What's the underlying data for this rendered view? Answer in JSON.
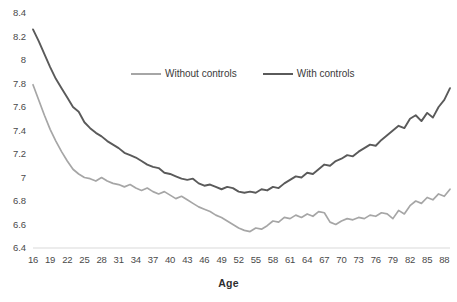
{
  "chart_data": {
    "type": "line",
    "title": "",
    "xlabel": "Age",
    "ylabel": "",
    "xlim": [
      16,
      89
    ],
    "ylim": [
      6.4,
      8.4
    ],
    "grid": false,
    "legend_position": "top-center",
    "x_tick_labels": [
      "16",
      "19",
      "22",
      "25",
      "28",
      "31",
      "34",
      "37",
      "40",
      "43",
      "46",
      "49",
      "52",
      "55",
      "58",
      "61",
      "64",
      "67",
      "70",
      "73",
      "76",
      "79",
      "82",
      "85",
      "88"
    ],
    "y_tick_labels": [
      "8.4",
      "8.2",
      "8",
      "7.8",
      "7.6",
      "7.4",
      "7.2",
      "7",
      "6.8",
      "6.6",
      "6.4"
    ],
    "y_tick_values": [
      8.4,
      8.2,
      8.0,
      7.8,
      7.6,
      7.4,
      7.2,
      7.0,
      6.8,
      6.6,
      6.4
    ],
    "x": [
      16,
      17,
      18,
      19,
      20,
      21,
      22,
      23,
      24,
      25,
      26,
      27,
      28,
      29,
      30,
      31,
      32,
      33,
      34,
      35,
      36,
      37,
      38,
      39,
      40,
      41,
      42,
      43,
      44,
      45,
      46,
      47,
      48,
      49,
      50,
      51,
      52,
      53,
      54,
      55,
      56,
      57,
      58,
      59,
      60,
      61,
      62,
      63,
      64,
      65,
      66,
      67,
      68,
      69,
      70,
      71,
      72,
      73,
      74,
      75,
      76,
      77,
      78,
      79,
      80,
      81,
      82,
      83,
      84,
      85,
      86,
      87,
      88,
      89
    ],
    "series": [
      {
        "name": "With controls",
        "color": "#5a5a5a",
        "values": [
          8.26,
          8.16,
          8.05,
          7.94,
          7.84,
          7.76,
          7.68,
          7.6,
          7.56,
          7.47,
          7.42,
          7.38,
          7.35,
          7.31,
          7.28,
          7.25,
          7.21,
          7.19,
          7.17,
          7.14,
          7.11,
          7.09,
          7.08,
          7.04,
          7.03,
          7.01,
          6.99,
          6.98,
          6.99,
          6.95,
          6.93,
          6.94,
          6.92,
          6.9,
          6.92,
          6.91,
          6.88,
          6.87,
          6.88,
          6.87,
          6.9,
          6.89,
          6.92,
          6.91,
          6.95,
          6.98,
          7.01,
          7.0,
          7.04,
          7.03,
          7.07,
          7.11,
          7.1,
          7.14,
          7.16,
          7.19,
          7.18,
          7.22,
          7.25,
          7.28,
          7.27,
          7.32,
          7.36,
          7.4,
          7.44,
          7.42,
          7.5,
          7.53,
          7.48,
          7.55,
          7.51,
          7.6,
          7.66,
          7.76
        ]
      },
      {
        "name": "Without controls",
        "color": "#a6a6a6",
        "values": [
          7.79,
          7.66,
          7.53,
          7.41,
          7.31,
          7.22,
          7.14,
          7.07,
          7.03,
          7.0,
          6.99,
          6.97,
          7.0,
          6.97,
          6.95,
          6.94,
          6.92,
          6.94,
          6.91,
          6.89,
          6.91,
          6.88,
          6.86,
          6.88,
          6.85,
          6.82,
          6.84,
          6.81,
          6.78,
          6.75,
          6.73,
          6.71,
          6.68,
          6.66,
          6.63,
          6.6,
          6.57,
          6.55,
          6.54,
          6.57,
          6.56,
          6.59,
          6.63,
          6.62,
          6.66,
          6.65,
          6.68,
          6.66,
          6.69,
          6.67,
          6.71,
          6.7,
          6.62,
          6.6,
          6.63,
          6.65,
          6.64,
          6.66,
          6.65,
          6.68,
          6.67,
          6.7,
          6.69,
          6.65,
          6.72,
          6.69,
          6.76,
          6.8,
          6.78,
          6.83,
          6.81,
          6.86,
          6.84,
          6.9
        ]
      }
    ]
  },
  "legend": {
    "items": [
      {
        "label": "Without controls",
        "style": "light"
      },
      {
        "label": "With controls",
        "style": "dark"
      }
    ]
  },
  "axis": {
    "x_title": "Age"
  }
}
